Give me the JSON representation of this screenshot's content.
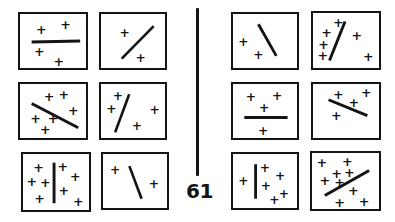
{
  "figure": {
    "page_number": "61",
    "ink_color": "#141414",
    "background_color": "#ffffff",
    "plus_glyph": "+",
    "divider_name": "vertical-rule",
    "panel_count": 12,
    "groups": [
      {
        "id": "left-group",
        "name": "left-panel-group",
        "panels": [
          {
            "id": "panel-1",
            "name": "panel-horizontal-line-2-above-2-below",
            "position": "top-left",
            "line": {
              "orientation": "horizontal",
              "x1": 12,
              "y1": 30,
              "x2": 62,
              "y2": 29,
              "width": 3.2
            },
            "plus_count": 4,
            "plus_marks": [
              {
                "x": 22,
                "y": 17,
                "size": 13
              },
              {
                "x": 47,
                "y": 12,
                "size": 13
              },
              {
                "x": 20,
                "y": 41,
                "size": 13
              },
              {
                "x": 40,
                "y": 52,
                "size": 13
              }
            ]
          },
          {
            "id": "panel-2",
            "name": "panel-diagonal-up-2-plus",
            "position": "top-right",
            "line": {
              "orientation": "diagonal-up",
              "x1": 22,
              "y1": 48,
              "x2": 56,
              "y2": 13,
              "width": 2.8
            },
            "plus_count": 2,
            "plus_marks": [
              {
                "x": 25,
                "y": 20,
                "size": 13
              },
              {
                "x": 42,
                "y": 47,
                "size": 13
              }
            ]
          },
          {
            "id": "panel-3",
            "name": "panel-diagonal-down-6-plus",
            "position": "middle-left",
            "line": {
              "orientation": "diagonal-down",
              "x1": 12,
              "y1": 21,
              "x2": 60,
              "y2": 47,
              "width": 3.0
            },
            "plus_count": 6,
            "plus_marks": [
              {
                "x": 30,
                "y": 14,
                "size": 13
              },
              {
                "x": 45,
                "y": 12,
                "size": 13
              },
              {
                "x": 55,
                "y": 29,
                "size": 13
              },
              {
                "x": 16,
                "y": 38,
                "size": 13
              },
              {
                "x": 34,
                "y": 38,
                "size": 13
              },
              {
                "x": 26,
                "y": 50,
                "size": 13
              }
            ]
          },
          {
            "id": "panel-4",
            "name": "panel-steep-diagonal-4-plus",
            "position": "middle-right",
            "line": {
              "orientation": "steep-up",
              "x1": 15,
              "y1": 52,
              "x2": 30,
              "y2": 11,
              "width": 2.8
            },
            "plus_count": 4,
            "plus_marks": [
              {
                "x": 18,
                "y": 13,
                "size": 13
              },
              {
                "x": 11,
                "y": 27,
                "size": 13
              },
              {
                "x": 57,
                "y": 28,
                "size": 13
              },
              {
                "x": 38,
                "y": 45,
                "size": 13
              }
            ]
          },
          {
            "id": "panel-5",
            "name": "panel-vertical-line-4-left-4-right",
            "position": "bottom-left",
            "line": {
              "orientation": "vertical",
              "x1": 32,
              "y1": 9,
              "x2": 32,
              "y2": 51,
              "width": 3.0
            },
            "plus_count": 8,
            "plus_marks": [
              {
                "x": 16,
                "y": 14,
                "size": 13
              },
              {
                "x": 9,
                "y": 29,
                "size": 13
              },
              {
                "x": 23,
                "y": 30,
                "size": 13
              },
              {
                "x": 17,
                "y": 46,
                "size": 13
              },
              {
                "x": 41,
                "y": 13,
                "size": 13
              },
              {
                "x": 54,
                "y": 23,
                "size": 13
              },
              {
                "x": 42,
                "y": 38,
                "size": 13
              },
              {
                "x": 57,
                "y": 49,
                "size": 13
              }
            ]
          },
          {
            "id": "panel-6",
            "name": "panel-steep-diagonal-2-plus",
            "position": "bottom-right",
            "line": {
              "orientation": "steep-down",
              "x1": 28,
              "y1": 13,
              "x2": 41,
              "y2": 48,
              "width": 2.8
            },
            "plus_count": 2,
            "plus_marks": [
              {
                "x": 13,
                "y": 17,
                "size": 13
              },
              {
                "x": 54,
                "y": 32,
                "size": 13
              }
            ]
          }
        ]
      },
      {
        "id": "right-group",
        "name": "right-panel-group",
        "panels": [
          {
            "id": "panel-7",
            "name": "panel-steep-diagonal-down-2-plus",
            "position": "top-left",
            "line": {
              "orientation": "steep-down",
              "x1": 27,
              "y1": 11,
              "x2": 46,
              "y2": 45,
              "width": 3.0
            },
            "plus_count": 2,
            "plus_marks": [
              {
                "x": 11,
                "y": 30,
                "size": 13
              },
              {
                "x": 27,
                "y": 44,
                "size": 13
              }
            ]
          },
          {
            "id": "panel-8",
            "name": "panel-steep-diagonal-up-6-plus",
            "position": "top-right",
            "line": {
              "orientation": "steep-up",
              "x1": 17,
              "y1": 50,
              "x2": 33,
              "y2": 9,
              "width": 3.0
            },
            "plus_count": 6,
            "plus_marks": [
              {
                "x": 26,
                "y": 10,
                "size": 13
              },
              {
                "x": 14,
                "y": 21,
                "size": 13
              },
              {
                "x": 11,
                "y": 33,
                "size": 13
              },
              {
                "x": 10,
                "y": 45,
                "size": 13
              },
              {
                "x": 45,
                "y": 24,
                "size": 13
              },
              {
                "x": 57,
                "y": 46,
                "size": 13
              }
            ]
          },
          {
            "id": "panel-9",
            "name": "panel-horizontal-line-3-above-1-below",
            "position": "middle-left",
            "line": {
              "orientation": "horizontal",
              "x1": 12,
              "y1": 36,
              "x2": 58,
              "y2": 36,
              "width": 3.2
            },
            "plus_count": 4,
            "plus_marks": [
              {
                "x": 19,
                "y": 14,
                "size": 13
              },
              {
                "x": 47,
                "y": 13,
                "size": 13
              },
              {
                "x": 33,
                "y": 26,
                "size": 13
              },
              {
                "x": 32,
                "y": 50,
                "size": 13
              }
            ]
          },
          {
            "id": "panel-10",
            "name": "panel-shallow-diagonal-down-4-plus",
            "position": "middle-right",
            "line": {
              "orientation": "diagonal-down",
              "x1": 16,
              "y1": 17,
              "x2": 56,
              "y2": 34,
              "width": 3.0
            },
            "plus_count": 4,
            "plus_marks": [
              {
                "x": 26,
                "y": 12,
                "size": 13
              },
              {
                "x": 55,
                "y": 10,
                "size": 13
              },
              {
                "x": 42,
                "y": 21,
                "size": 13
              },
              {
                "x": 24,
                "y": 35,
                "size": 13
              }
            ]
          },
          {
            "id": "panel-11",
            "name": "panel-vertical-line-1-left-5-right",
            "position": "bottom-left",
            "line": {
              "orientation": "vertical",
              "x1": 24,
              "y1": 11,
              "x2": 24,
              "y2": 48,
              "width": 3.0
            },
            "plus_count": 6,
            "plus_marks": [
              {
                "x": 11,
                "y": 29,
                "size": 13
              },
              {
                "x": 34,
                "y": 15,
                "size": 13
              },
              {
                "x": 50,
                "y": 24,
                "size": 13
              },
              {
                "x": 35,
                "y": 34,
                "size": 13
              },
              {
                "x": 54,
                "y": 43,
                "size": 13
              },
              {
                "x": 44,
                "y": 49,
                "size": 13
              }
            ]
          },
          {
            "id": "panel-12",
            "name": "panel-diagonal-up-9-plus",
            "position": "bottom-right",
            "line": {
              "orientation": "diagonal-up",
              "x1": 13,
              "y1": 44,
              "x2": 58,
              "y2": 18,
              "width": 3.0
            },
            "plus_count": 9,
            "plus_marks": [
              {
                "x": 10,
                "y": 10,
                "size": 13
              },
              {
                "x": 36,
                "y": 9,
                "size": 13
              },
              {
                "x": 25,
                "y": 21,
                "size": 13
              },
              {
                "x": 38,
                "y": 20,
                "size": 13
              },
              {
                "x": 13,
                "y": 29,
                "size": 13
              },
              {
                "x": 28,
                "y": 31,
                "size": 13
              },
              {
                "x": 42,
                "y": 39,
                "size": 13
              },
              {
                "x": 28,
                "y": 51,
                "size": 13
              },
              {
                "x": 53,
                "y": 50,
                "size": 13
              }
            ]
          }
        ]
      }
    ]
  }
}
